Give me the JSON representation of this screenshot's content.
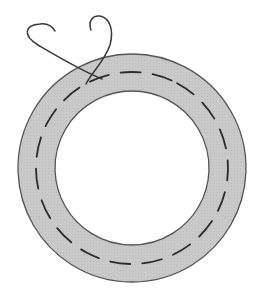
{
  "figure": {
    "colors": {
      "background": "#ffffff",
      "ring_fill": "#c8c8c8",
      "outline": "#555555",
      "stitch": "#2b2b2b",
      "thread": "#3a3a3a"
    },
    "ring": {
      "center_x": 132,
      "center_y": 168,
      "outer_radius": 114,
      "inner_radius": 77,
      "stitch_radius": 96
    }
  }
}
